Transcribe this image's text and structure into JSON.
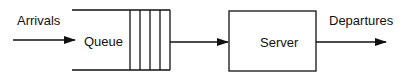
{
  "diagram": {
    "arrivals_label": "Arrivals",
    "queue_label": "Queue",
    "server_label": "Server",
    "departures_label": "Departures",
    "queue_slots": 4,
    "stroke_color": "#111111"
  }
}
